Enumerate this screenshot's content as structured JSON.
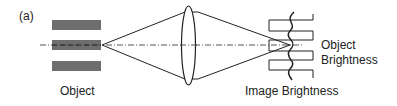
{
  "figure": {
    "panel_label": "(a)",
    "labels": {
      "object": "Object",
      "image_brightness": "Image Brightness",
      "object_brightness_line1": "Object",
      "object_brightness_line2": "Brightness"
    },
    "colors": {
      "bars": "#6e6e6e",
      "lines": "#222222",
      "axis": "#555555"
    }
  }
}
